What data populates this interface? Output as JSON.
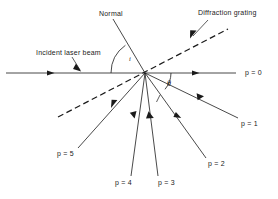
{
  "figure": {
    "kind": "optics-ray-diagram",
    "subject": "Diffraction grating",
    "background_color": "#ffffff",
    "line_color": "#1a1a1a",
    "text_color": "#1a1a1a"
  },
  "labels": {
    "normal": "Normal",
    "diffraction_grating": "Diffraction grating",
    "incident_beam": "Incident laser beam",
    "angle_incidence": "i",
    "angle_diffraction": "θ",
    "order_0": "p = 0",
    "order_1": "p = 1",
    "order_2": "p = 2",
    "order_3": "p = 3",
    "order_4": "p = 4",
    "order_5": "p = 5"
  },
  "geometry": {
    "vertex": {
      "x": 145,
      "y": 73
    },
    "incident_axis": {
      "x1": 6,
      "y1": 73,
      "x2": 236,
      "y2": 73
    },
    "normal_line": {
      "x1": 113,
      "y1": 19,
      "x2": 145,
      "y2": 73
    },
    "grating_line": {
      "x1": 58,
      "y1": 117,
      "x2": 228,
      "y2": 29,
      "style": "dashed"
    },
    "orders": [
      {
        "label": "p = 1",
        "x": 238,
        "y": 118
      },
      {
        "label": "p = 2",
        "x": 206,
        "y": 158
      },
      {
        "label": "p = 3",
        "x": 158,
        "y": 176
      },
      {
        "label": "p = 4",
        "x": 131,
        "y": 176
      },
      {
        "label": "p = 5",
        "x": 78,
        "y": 148
      }
    ],
    "arc_incidence": {
      "radius": 34
    },
    "arc_diffraction": {
      "radius": 26
    }
  }
}
